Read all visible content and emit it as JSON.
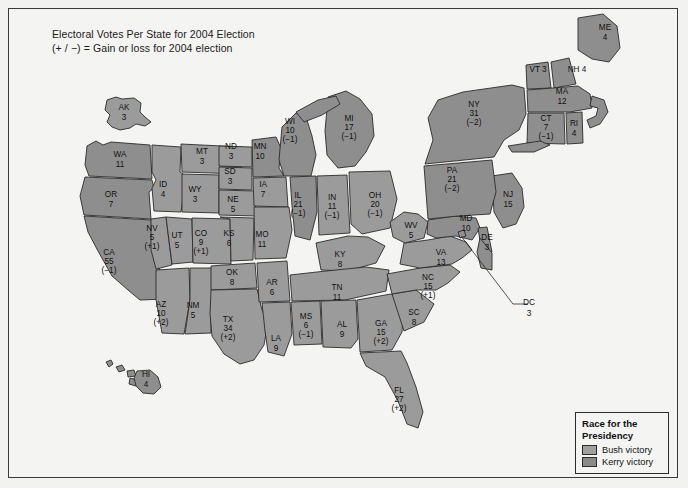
{
  "title": {
    "line1": "Electoral Votes Per State for 2004 Election",
    "line2": "(+ / −) = Gain or loss for 2004 election"
  },
  "legend": {
    "title_line1": "Race for the",
    "title_line2": "Presidency",
    "bush_label": "Bush victory",
    "kerry_label": "Kerry victory",
    "bush_color": "#a0a0a0",
    "kerry_color": "#8a8a8a"
  },
  "callouts": {
    "dc_abbr": "DC",
    "dc_votes": "3"
  },
  "chart_data": {
    "type": "map",
    "title": "Electoral Votes Per State for 2004 Election",
    "subtitle": "(+ / −) = Gain or loss for 2004 election",
    "legend": [
      "Bush victory",
      "Kerry victory"
    ],
    "states": [
      {
        "abbr": "WA",
        "votes": "11",
        "change": "",
        "winner": "Kerry",
        "x": 120,
        "y": 160
      },
      {
        "abbr": "OR",
        "votes": "7",
        "change": "",
        "winner": "Kerry",
        "x": 111,
        "y": 200
      },
      {
        "abbr": "CA",
        "votes": "55",
        "change": "(−1)",
        "winner": "Kerry",
        "x": 109,
        "y": 262
      },
      {
        "abbr": "NV",
        "votes": "5",
        "change": "(+1)",
        "winner": "Bush",
        "x": 152,
        "y": 238
      },
      {
        "abbr": "ID",
        "votes": "4",
        "change": "",
        "winner": "Bush",
        "x": 163,
        "y": 190
      },
      {
        "abbr": "MT",
        "votes": "3",
        "change": "",
        "winner": "Bush",
        "x": 202,
        "y": 157
      },
      {
        "abbr": "WY",
        "votes": "3",
        "change": "",
        "winner": "Bush",
        "x": 195,
        "y": 195
      },
      {
        "abbr": "UT",
        "votes": "5",
        "change": "",
        "winner": "Bush",
        "x": 177,
        "y": 241
      },
      {
        "abbr": "AZ",
        "votes": "10",
        "change": "(+2)",
        "winner": "Bush",
        "x": 161,
        "y": 314
      },
      {
        "abbr": "NM",
        "votes": "5",
        "change": "",
        "winner": "Bush",
        "x": 193,
        "y": 311
      },
      {
        "abbr": "CO",
        "votes": "9",
        "change": "(+1)",
        "winner": "Bush",
        "x": 201,
        "y": 243
      },
      {
        "abbr": "ND",
        "votes": "3",
        "change": "",
        "winner": "Bush",
        "x": 231,
        "y": 152
      },
      {
        "abbr": "SD",
        "votes": "3",
        "change": "",
        "winner": "Bush",
        "x": 230,
        "y": 177
      },
      {
        "abbr": "NE",
        "votes": "5",
        "change": "",
        "winner": "Bush",
        "x": 233,
        "y": 205
      },
      {
        "abbr": "KS",
        "votes": "6",
        "change": "",
        "winner": "Bush",
        "x": 229,
        "y": 239
      },
      {
        "abbr": "OK",
        "votes": "8",
        "change": "",
        "winner": "Bush",
        "x": 232,
        "y": 278
      },
      {
        "abbr": "TX",
        "votes": "34",
        "change": "(+2)",
        "winner": "Bush",
        "x": 228,
        "y": 329
      },
      {
        "abbr": "MN",
        "votes": "10",
        "change": "",
        "winner": "Kerry",
        "x": 260,
        "y": 152
      },
      {
        "abbr": "IA",
        "votes": "7",
        "change": "",
        "winner": "Bush",
        "x": 263,
        "y": 190
      },
      {
        "abbr": "MO",
        "votes": "11",
        "change": "",
        "winner": "Bush",
        "x": 262,
        "y": 240
      },
      {
        "abbr": "AR",
        "votes": "6",
        "change": "",
        "winner": "Bush",
        "x": 272,
        "y": 288
      },
      {
        "abbr": "LA",
        "votes": "9",
        "change": "",
        "winner": "Bush",
        "x": 276,
        "y": 344
      },
      {
        "abbr": "WI",
        "votes": "10",
        "change": "(−1)",
        "winner": "Kerry",
        "x": 290,
        "y": 131
      },
      {
        "abbr": "IL",
        "votes": "21",
        "change": "(−1)",
        "winner": "Kerry",
        "x": 298,
        "y": 205
      },
      {
        "abbr": "MS",
        "votes": "6",
        "change": "(−1)",
        "winner": "Bush",
        "x": 306,
        "y": 326
      },
      {
        "abbr": "MI",
        "votes": "17",
        "change": "(−1)",
        "winner": "Kerry",
        "x": 349,
        "y": 128
      },
      {
        "abbr": "IN",
        "votes": "11",
        "change": "(−1)",
        "winner": "Bush",
        "x": 332,
        "y": 207
      },
      {
        "abbr": "KY",
        "votes": "8",
        "change": "",
        "winner": "Bush",
        "x": 340,
        "y": 260
      },
      {
        "abbr": "TN",
        "votes": "11",
        "change": "",
        "winner": "Bush",
        "x": 337,
        "y": 293
      },
      {
        "abbr": "AL",
        "votes": "9",
        "change": "",
        "winner": "Bush",
        "x": 342,
        "y": 330
      },
      {
        "abbr": "OH",
        "votes": "20",
        "change": "(−1)",
        "winner": "Bush",
        "x": 375,
        "y": 205
      },
      {
        "abbr": "GA",
        "votes": "15",
        "change": "(+2)",
        "winner": "Bush",
        "x": 381,
        "y": 333
      },
      {
        "abbr": "FL",
        "votes": "27",
        "change": "(+2)",
        "winner": "Bush",
        "x": 399,
        "y": 400
      },
      {
        "abbr": "WV",
        "votes": "5",
        "change": "",
        "winner": "Bush",
        "x": 411,
        "y": 231
      },
      {
        "abbr": "SC",
        "votes": "8",
        "change": "",
        "winner": "Bush",
        "x": 414,
        "y": 318
      },
      {
        "abbr": "NC",
        "votes": "15",
        "change": "(+1)",
        "winner": "Bush",
        "x": 428,
        "y": 287
      },
      {
        "abbr": "VA",
        "votes": "13",
        "change": "",
        "winner": "Bush",
        "x": 441,
        "y": 258
      },
      {
        "abbr": "PA",
        "votes": "21",
        "change": "(−2)",
        "winner": "Kerry",
        "x": 452,
        "y": 180
      },
      {
        "abbr": "MD",
        "votes": "10",
        "change": "",
        "winner": "Kerry",
        "x": 466,
        "y": 224
      },
      {
        "abbr": "DE",
        "votes": "3",
        "change": "",
        "winner": "Kerry",
        "x": 487,
        "y": 243
      },
      {
        "abbr": "NJ",
        "votes": "15",
        "change": "",
        "winner": "Kerry",
        "x": 508,
        "y": 200
      },
      {
        "abbr": "NY",
        "votes": "31",
        "change": "(−2)",
        "winner": "Kerry",
        "x": 474,
        "y": 114
      },
      {
        "abbr": "CT",
        "votes": "7",
        "change": "(−1)",
        "winner": "Kerry",
        "x": 546,
        "y": 128
      },
      {
        "abbr": "RI",
        "votes": "4",
        "change": "",
        "winner": "Kerry",
        "x": 574,
        "y": 129
      },
      {
        "abbr": "MA",
        "votes": "12",
        "change": "",
        "winner": "Kerry",
        "x": 562,
        "y": 97
      },
      {
        "abbr": "VT",
        "votes": "3",
        "change": "",
        "winner": "Kerry",
        "x": 538,
        "y": 70
      },
      {
        "abbr": "NH",
        "votes": "4",
        "change": "",
        "winner": "Kerry",
        "x": 577,
        "y": 70
      },
      {
        "abbr": "ME",
        "votes": "4",
        "change": "",
        "winner": "Kerry",
        "x": 605,
        "y": 33
      },
      {
        "abbr": "AK",
        "votes": "3",
        "change": "",
        "winner": "Bush",
        "x": 124,
        "y": 113
      },
      {
        "abbr": "HI",
        "votes": "4",
        "change": "",
        "winner": "Kerry",
        "x": 146,
        "y": 380
      },
      {
        "abbr": "DC",
        "votes": "3",
        "change": "",
        "winner": "Kerry",
        "x": 529,
        "y": 303
      }
    ]
  }
}
